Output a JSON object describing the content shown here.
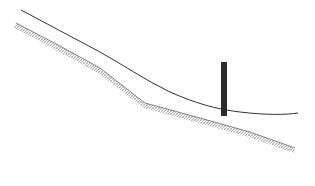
{
  "diagram": {
    "colors": {
      "background": "#ffffff",
      "surface_line": "#333333",
      "ground_hatch": "#8a8a8a",
      "post": "#2b2b2b"
    },
    "elements": {
      "surface_line": {
        "points": [
          [
            21,
            10
          ],
          [
            60,
            30
          ],
          [
            100,
            52
          ],
          [
            140,
            75
          ],
          [
            165,
            90
          ],
          [
            190,
            101
          ],
          [
            222,
            110
          ],
          [
            250,
            114
          ],
          [
            275,
            115
          ],
          [
            298,
            113
          ]
        ]
      },
      "ground": {
        "points": [
          [
            16,
            23
          ],
          [
            60,
            46
          ],
          [
            100,
            68
          ],
          [
            145,
            103
          ],
          [
            200,
            118
          ],
          [
            250,
            132
          ],
          [
            295,
            148
          ]
        ]
      },
      "post": {
        "x": 221,
        "y": 62,
        "width": 6,
        "height": 54
      }
    }
  }
}
